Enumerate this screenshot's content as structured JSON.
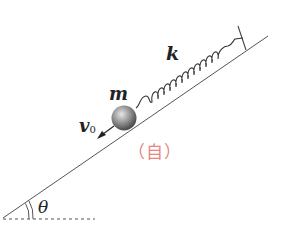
{
  "diagram": {
    "type": "physics-incline-spring-mass",
    "labels": {
      "spring_constant": "k",
      "mass": "m",
      "velocity_symbol": "v",
      "velocity_subscript": "0",
      "angle": "θ",
      "annotation": "（自）"
    },
    "colors": {
      "line": "#555555",
      "annotation": "#e8837f",
      "ball_light": "#d9d9d9",
      "ball_dark": "#555555"
    },
    "elements": [
      "inclined-plane",
      "horizontal-dashed-reference",
      "angle-arc",
      "spring",
      "wall-mount",
      "ball-mass",
      "velocity-arrow"
    ]
  }
}
